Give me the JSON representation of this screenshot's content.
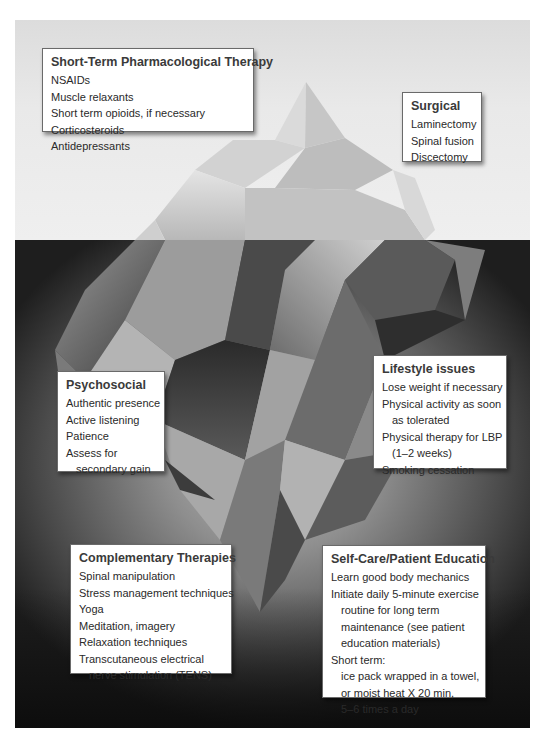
{
  "diagram": {
    "type": "iceberg",
    "description_labels": {
      "above_water": "visible interventions",
      "below_water": "underlying interventions"
    },
    "colors": {
      "sky": "#e6e6e6",
      "water_dark": "#1e1e1e",
      "water_light": "#bdbdbd",
      "box_bg": "#ffffff",
      "box_border": "#6a6a6a",
      "text": "#2a2a2a"
    }
  },
  "boxes": {
    "pharmacological": {
      "title": "Short-Term Pharmacological Therapy",
      "items": [
        "NSAIDs",
        "Muscle relaxants",
        "Short term opioids, if necessary",
        "Corticosteroids",
        "Antidepressants"
      ]
    },
    "surgical": {
      "title": "Surgical",
      "items": [
        "Laminectomy",
        "Spinal fusion",
        "Discectomy"
      ]
    },
    "lifestyle": {
      "title": "Lifestyle issues",
      "items": [
        "Lose weight if necessary",
        "Physical activity as soon",
        "as tolerated",
        "Physical therapy for LBP",
        "(1–2 weeks)",
        "Smoking cessation"
      ]
    },
    "psychosocial": {
      "title": "Psychosocial",
      "items": [
        "Authentic presence",
        "Active listening",
        "Patience",
        "Assess for",
        "secondary gain"
      ]
    },
    "complementary": {
      "title": "Complementary Therapies",
      "items": [
        "Spinal manipulation",
        "Stress management techniques",
        "Yoga",
        "Meditation, imagery",
        "Relaxation techniques",
        "Transcutaneous electrical",
        "nerve stimulation (TENS)"
      ]
    },
    "selfcare": {
      "title": "Self-Care/Patient Education",
      "items": [
        "Learn good body mechanics",
        "Initiate daily 5-minute exercise",
        "routine for long term",
        "maintenance (see patient",
        "education materials)",
        "Short term:",
        "ice pack wrapped in a towel,",
        "or moist heat X 20 min,",
        "5–6 times a day"
      ]
    }
  }
}
